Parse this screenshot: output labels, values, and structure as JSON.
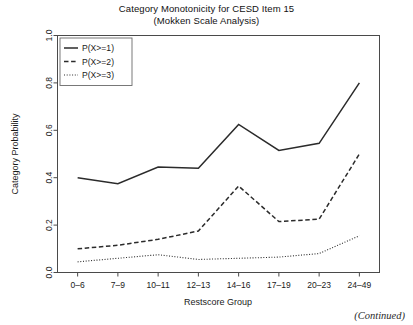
{
  "figure": {
    "title_line1": "Category Monotonicity for CESD Item 15",
    "title_line2": "(Mokken Scale Analysis)",
    "continued_note": "(Continued)"
  },
  "chart_data": {
    "type": "line",
    "title": "Category Monotonicity for CESD Item 15 (Mokken Scale Analysis)",
    "xlabel": "Restscore Group",
    "ylabel": "Category Probability",
    "categories": [
      "0–6",
      "7–9",
      "10–11",
      "12–13",
      "14–16",
      "17–19",
      "20–23",
      "24–49"
    ],
    "ylim": [
      0.0,
      1.0
    ],
    "yticks": [
      0.0,
      0.2,
      0.4,
      0.6,
      0.8,
      1.0
    ],
    "ytick_labels": [
      "0.0",
      "0.2",
      "0.4",
      "0.6",
      "0.8",
      "1.0"
    ],
    "grid": false,
    "legend_position": "top-left",
    "series": [
      {
        "name": "P(X>=1)",
        "style": "solid",
        "color": "#2b2b2b",
        "values": [
          0.4,
          0.375,
          0.445,
          0.44,
          0.625,
          0.515,
          0.545,
          0.8
        ]
      },
      {
        "name": "P(X>=2)",
        "style": "dashed",
        "color": "#2b2b2b",
        "values": [
          0.1,
          0.115,
          0.14,
          0.175,
          0.365,
          0.215,
          0.225,
          0.5
        ]
      },
      {
        "name": "P(X>=3)",
        "style": "dotted",
        "color": "#2b2b2b",
        "values": [
          0.045,
          0.06,
          0.075,
          0.055,
          0.06,
          0.065,
          0.08,
          0.155
        ]
      }
    ]
  }
}
